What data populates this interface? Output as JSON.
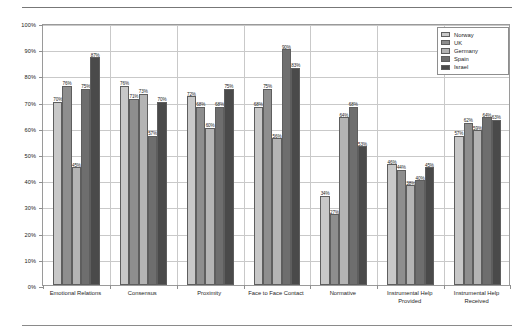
{
  "chart_data": {
    "type": "bar",
    "title": "",
    "xlabel": "",
    "ylabel": "",
    "ylim": [
      0,
      100
    ],
    "ytick_labels": [
      "0%",
      "10%",
      "20%",
      "30%",
      "40%",
      "50%",
      "60%",
      "70%",
      "80%",
      "90%",
      "100%"
    ],
    "ytick_values": [
      0,
      10,
      20,
      30,
      40,
      50,
      60,
      70,
      80,
      90,
      100
    ],
    "grid": "horizontal",
    "legend_position": "top-right",
    "value_suffix": "%",
    "categories": [
      "Emotional Relations",
      "Consensus",
      "Proximity",
      "Face to Face Contact",
      "Normative",
      "Instrumental Help\nProvided",
      "Instrumental Help\nReceived"
    ],
    "series": [
      {
        "name": "Norway",
        "color": "#c8c8c8",
        "values": [
          70,
          76,
          72,
          68,
          34,
          46,
          57
        ]
      },
      {
        "name": "UK",
        "color": "#8e8e8e",
        "values": [
          76,
          71,
          68,
          75,
          27,
          44,
          62
        ]
      },
      {
        "name": "Germany",
        "color": "#b4b4b4",
        "values": [
          45,
          73,
          60,
          56,
          64,
          38,
          59
        ]
      },
      {
        "name": "Spain",
        "color": "#6e6e6e",
        "values": [
          75,
          57,
          68,
          90,
          68,
          40,
          64
        ]
      },
      {
        "name": "Israel",
        "color": "#4a4a4a",
        "values": [
          87,
          70,
          75,
          83,
          53,
          45,
          63
        ]
      }
    ],
    "data_labels": [
      [
        "70%",
        "76%",
        "45%",
        "75%",
        "87%"
      ],
      [
        "76%",
        "71%",
        "73%",
        "57%",
        "70%"
      ],
      [
        "72%",
        "68%",
        "60%",
        "68%",
        "75%"
      ],
      [
        "68%",
        "75%",
        "56%",
        "90%",
        "83%"
      ],
      [
        "34%",
        "27%",
        "64%",
        "68%",
        "53%"
      ],
      [
        "46%",
        "44%",
        "38%",
        "40%",
        "45%"
      ],
      [
        "57%",
        "62%",
        "59%",
        "64%",
        "63%"
      ]
    ]
  }
}
